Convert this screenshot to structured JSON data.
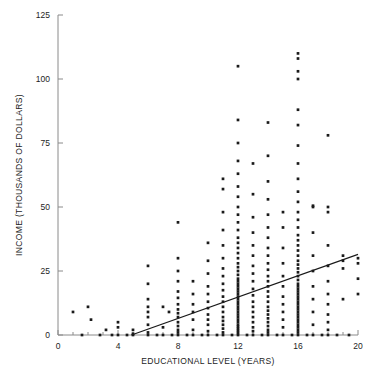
{
  "chart_data": {
    "type": "scatter",
    "title": "",
    "xlabel": "EDUCATIONAL LEVEL (YEARS)",
    "ylabel": "INCOME (THOUSANDS OF DOLLARS)",
    "xlim": [
      0,
      20
    ],
    "ylim": [
      0,
      125
    ],
    "xticks": [
      0,
      4,
      8,
      12,
      16,
      20
    ],
    "yticks": [
      0,
      25,
      50,
      75,
      100,
      125
    ],
    "xtick_labels": [
      "0",
      "4",
      "8",
      "12",
      "16",
      "20"
    ],
    "ytick_labels": [
      "0",
      "25",
      "50",
      "75",
      "100",
      "125"
    ],
    "x_minor_tick_step": 1,
    "grid": false,
    "legend": "none",
    "marker": "dot",
    "marker_color": "#1a1a1a",
    "marker_size_px": 2,
    "trendline": {
      "label": "regression line",
      "color": "#1a1a1a",
      "x_start": 4.9,
      "y_start": 0,
      "x_end": 20,
      "y_end": 31.5
    },
    "points": [
      [
        1.0,
        9.0
      ],
      [
        1.6,
        0.0
      ],
      [
        2.0,
        11.0
      ],
      [
        2.2,
        6.0
      ],
      [
        2.8,
        0.0
      ],
      [
        3.2,
        2.0
      ],
      [
        3.6,
        0.0
      ],
      [
        4.0,
        0.0
      ],
      [
        4.0,
        3.0
      ],
      [
        4.0,
        5.0
      ],
      [
        4.6,
        0.0
      ],
      [
        5.0,
        0.0
      ],
      [
        5.0,
        0.5
      ],
      [
        5.0,
        2.0
      ],
      [
        6.0,
        0.0
      ],
      [
        6.0,
        1.0
      ],
      [
        6.0,
        4.0
      ],
      [
        6.0,
        7.0
      ],
      [
        6.0,
        9.0
      ],
      [
        6.0,
        11.0
      ],
      [
        6.0,
        14.0
      ],
      [
        6.0,
        20.0
      ],
      [
        6.0,
        27.0
      ],
      [
        6.6,
        0.0
      ],
      [
        7.0,
        0.0
      ],
      [
        7.0,
        3.0
      ],
      [
        7.0,
        11.0
      ],
      [
        7.4,
        9.0
      ],
      [
        7.6,
        0.0
      ],
      [
        8.0,
        0.0
      ],
      [
        8.0,
        1.0
      ],
      [
        8.0,
        2.0
      ],
      [
        8.0,
        3.5
      ],
      [
        8.0,
        5.0
      ],
      [
        8.0,
        7.0
      ],
      [
        8.0,
        8.5
      ],
      [
        8.0,
        10.0
      ],
      [
        8.0,
        12.0
      ],
      [
        8.0,
        14.5
      ],
      [
        8.0,
        17.0
      ],
      [
        8.0,
        21.0
      ],
      [
        8.0,
        25.0
      ],
      [
        8.0,
        30.0
      ],
      [
        8.0,
        44.0
      ],
      [
        8.6,
        0.0
      ],
      [
        9.0,
        0.0
      ],
      [
        9.0,
        2.0
      ],
      [
        9.0,
        6.0
      ],
      [
        9.0,
        9.0
      ],
      [
        9.0,
        12.0
      ],
      [
        9.0,
        16.0
      ],
      [
        9.0,
        21.0
      ],
      [
        9.6,
        0.0
      ],
      [
        10.0,
        0.0
      ],
      [
        10.0,
        1.5
      ],
      [
        10.0,
        4.0
      ],
      [
        10.0,
        6.0
      ],
      [
        10.0,
        8.0
      ],
      [
        10.0,
        10.5
      ],
      [
        10.0,
        13.0
      ],
      [
        10.0,
        16.0
      ],
      [
        10.0,
        19.0
      ],
      [
        10.0,
        24.0
      ],
      [
        10.0,
        29.0
      ],
      [
        10.0,
        36.0
      ],
      [
        10.6,
        0.0
      ],
      [
        11.0,
        0.0
      ],
      [
        11.0,
        1.0
      ],
      [
        11.0,
        2.5
      ],
      [
        11.0,
        4.0
      ],
      [
        11.0,
        5.5
      ],
      [
        11.0,
        7.0
      ],
      [
        11.0,
        9.0
      ],
      [
        11.0,
        11.0
      ],
      [
        11.0,
        13.0
      ],
      [
        11.0,
        15.0
      ],
      [
        11.0,
        17.5
      ],
      [
        11.0,
        20.0
      ],
      [
        11.0,
        23.0
      ],
      [
        11.0,
        26.0
      ],
      [
        11.0,
        30.0
      ],
      [
        11.0,
        35.0
      ],
      [
        11.0,
        41.0
      ],
      [
        11.0,
        48.0
      ],
      [
        11.0,
        57.0
      ],
      [
        11.0,
        61.0
      ],
      [
        11.6,
        0.0
      ],
      [
        12.0,
        0.0
      ],
      [
        12.0,
        0.8
      ],
      [
        12.0,
        1.6
      ],
      [
        12.0,
        2.4
      ],
      [
        12.0,
        3.2
      ],
      [
        12.0,
        4.0
      ],
      [
        12.0,
        5.0
      ],
      [
        12.0,
        6.0
      ],
      [
        12.0,
        7.0
      ],
      [
        12.0,
        8.0
      ],
      [
        12.0,
        9.0
      ],
      [
        12.0,
        10.0
      ],
      [
        12.0,
        11.0
      ],
      [
        12.0,
        12.0
      ],
      [
        12.0,
        13.0
      ],
      [
        12.0,
        14.0
      ],
      [
        12.0,
        15.0
      ],
      [
        12.0,
        16.0
      ],
      [
        12.0,
        17.0
      ],
      [
        12.0,
        18.0
      ],
      [
        12.0,
        19.0
      ],
      [
        12.0,
        20.0
      ],
      [
        12.0,
        21.0
      ],
      [
        12.0,
        22.0
      ],
      [
        12.0,
        23.5
      ],
      [
        12.0,
        25.0
      ],
      [
        12.0,
        26.5
      ],
      [
        12.0,
        28.0
      ],
      [
        12.0,
        30.0
      ],
      [
        12.0,
        32.0
      ],
      [
        12.0,
        34.0
      ],
      [
        12.0,
        36.0
      ],
      [
        12.0,
        38.0
      ],
      [
        12.0,
        41.0
      ],
      [
        12.0,
        44.0
      ],
      [
        12.0,
        47.0
      ],
      [
        12.0,
        50.0
      ],
      [
        12.0,
        54.0
      ],
      [
        12.0,
        58.0
      ],
      [
        12.0,
        63.0
      ],
      [
        12.0,
        68.0
      ],
      [
        12.0,
        75.0
      ],
      [
        12.0,
        84.0
      ],
      [
        12.0,
        105.0
      ],
      [
        12.6,
        0.0
      ],
      [
        13.0,
        0.0
      ],
      [
        13.0,
        1.5
      ],
      [
        13.0,
        3.0
      ],
      [
        13.0,
        5.0
      ],
      [
        13.0,
        7.0
      ],
      [
        13.0,
        9.0
      ],
      [
        13.0,
        11.0
      ],
      [
        13.0,
        13.0
      ],
      [
        13.0,
        15.5
      ],
      [
        13.0,
        18.0
      ],
      [
        13.0,
        21.0
      ],
      [
        13.0,
        24.0
      ],
      [
        13.0,
        27.0
      ],
      [
        13.0,
        31.0
      ],
      [
        13.0,
        35.0
      ],
      [
        13.0,
        40.0
      ],
      [
        13.0,
        46.0
      ],
      [
        13.0,
        55.0
      ],
      [
        13.0,
        67.0
      ],
      [
        13.6,
        0.0
      ],
      [
        14.0,
        0.0
      ],
      [
        14.0,
        1.0
      ],
      [
        14.0,
        2.0
      ],
      [
        14.0,
        3.5
      ],
      [
        14.0,
        5.0
      ],
      [
        14.0,
        6.5
      ],
      [
        14.0,
        8.0
      ],
      [
        14.0,
        9.5
      ],
      [
        14.0,
        11.0
      ],
      [
        14.0,
        13.0
      ],
      [
        14.0,
        15.0
      ],
      [
        14.0,
        17.0
      ],
      [
        14.0,
        19.0
      ],
      [
        14.0,
        21.0
      ],
      [
        14.0,
        23.0
      ],
      [
        14.0,
        25.5
      ],
      [
        14.0,
        28.0
      ],
      [
        14.0,
        31.0
      ],
      [
        14.0,
        34.0
      ],
      [
        14.0,
        38.0
      ],
      [
        14.0,
        42.0
      ],
      [
        14.0,
        47.0
      ],
      [
        14.0,
        53.0
      ],
      [
        14.0,
        60.0
      ],
      [
        14.0,
        70.0
      ],
      [
        14.0,
        83.0
      ],
      [
        14.6,
        0.0
      ],
      [
        15.0,
        0.0
      ],
      [
        15.0,
        3.0
      ],
      [
        15.0,
        6.0
      ],
      [
        15.0,
        9.0
      ],
      [
        15.0,
        12.0
      ],
      [
        15.0,
        15.0
      ],
      [
        15.0,
        19.0
      ],
      [
        15.0,
        23.0
      ],
      [
        15.0,
        28.0
      ],
      [
        15.0,
        34.0
      ],
      [
        15.0,
        42.0
      ],
      [
        15.0,
        48.0
      ],
      [
        15.6,
        0.0
      ],
      [
        16.0,
        0.0
      ],
      [
        16.0,
        1.0
      ],
      [
        16.0,
        2.0
      ],
      [
        16.0,
        3.0
      ],
      [
        16.0,
        4.0
      ],
      [
        16.0,
        5.0
      ],
      [
        16.0,
        6.0
      ],
      [
        16.0,
        7.0
      ],
      [
        16.0,
        8.0
      ],
      [
        16.0,
        9.0
      ],
      [
        16.0,
        10.0
      ],
      [
        16.0,
        11.0
      ],
      [
        16.0,
        12.0
      ],
      [
        16.0,
        13.0
      ],
      [
        16.0,
        14.0
      ],
      [
        16.0,
        15.0
      ],
      [
        16.0,
        16.0
      ],
      [
        16.0,
        17.0
      ],
      [
        16.0,
        18.0
      ],
      [
        16.0,
        19.0
      ],
      [
        16.0,
        20.0
      ],
      [
        16.0,
        21.5
      ],
      [
        16.0,
        23.0
      ],
      [
        16.0,
        24.5
      ],
      [
        16.0,
        26.0
      ],
      [
        16.0,
        27.5
      ],
      [
        16.0,
        29.0
      ],
      [
        16.0,
        31.0
      ],
      [
        16.0,
        33.0
      ],
      [
        16.0,
        35.0
      ],
      [
        16.0,
        37.0
      ],
      [
        16.0,
        39.0
      ],
      [
        16.0,
        42.0
      ],
      [
        16.0,
        45.0
      ],
      [
        16.0,
        48.0
      ],
      [
        16.0,
        52.0
      ],
      [
        16.0,
        56.0
      ],
      [
        16.0,
        61.0
      ],
      [
        16.0,
        67.0
      ],
      [
        16.0,
        74.0
      ],
      [
        16.0,
        82.0
      ],
      [
        16.0,
        88.0
      ],
      [
        16.0,
        100.0
      ],
      [
        16.0,
        103.0
      ],
      [
        16.0,
        108.0
      ],
      [
        16.0,
        110.0
      ],
      [
        16.6,
        0.0
      ],
      [
        17.0,
        0.0
      ],
      [
        17.0,
        4.0
      ],
      [
        17.0,
        9.0
      ],
      [
        17.0,
        14.0
      ],
      [
        17.0,
        19.0
      ],
      [
        17.0,
        25.0
      ],
      [
        17.0,
        31.0
      ],
      [
        17.0,
        40.0
      ],
      [
        17.0,
        50.0
      ],
      [
        17.0,
        50.5
      ],
      [
        17.6,
        0.0
      ],
      [
        18.0,
        0.0
      ],
      [
        18.0,
        2.0
      ],
      [
        18.0,
        5.0
      ],
      [
        18.0,
        8.0
      ],
      [
        18.0,
        12.0
      ],
      [
        18.0,
        16.0
      ],
      [
        18.0,
        21.0
      ],
      [
        18.0,
        27.0
      ],
      [
        18.0,
        35.0
      ],
      [
        18.0,
        48.0
      ],
      [
        18.0,
        50.0
      ],
      [
        18.0,
        78.0
      ],
      [
        18.6,
        0.0
      ],
      [
        19.0,
        14.0
      ],
      [
        19.0,
        26.0
      ],
      [
        19.0,
        29.0
      ],
      [
        19.0,
        31.0
      ],
      [
        19.4,
        0.0
      ],
      [
        20.0,
        16.0
      ],
      [
        20.0,
        22.0
      ],
      [
        20.0,
        28.0
      ],
      [
        20.0,
        30.0
      ]
    ]
  },
  "axes": {
    "x_axis_name": "educational-level-axis",
    "y_axis_name": "income-axis"
  }
}
